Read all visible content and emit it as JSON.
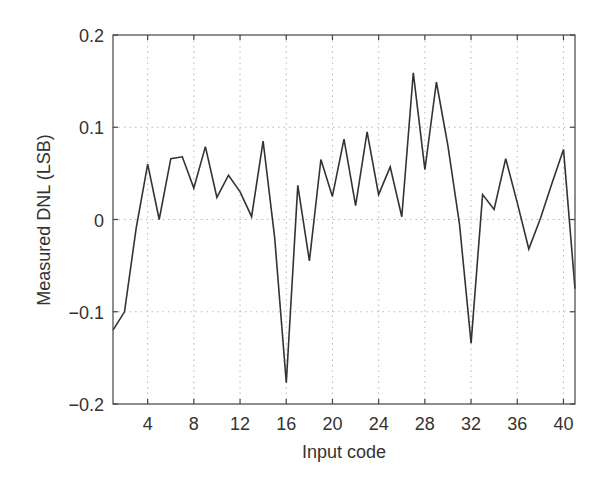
{
  "chart_data": {
    "type": "line",
    "title": "",
    "xlabel": "Input code",
    "ylabel": "Measured DNL (LSB)",
    "xlim": [
      1,
      41
    ],
    "ylim": [
      -0.2,
      0.2
    ],
    "grid": true,
    "legend": null,
    "xticks": [
      4,
      8,
      12,
      16,
      20,
      24,
      28,
      32,
      36,
      40
    ],
    "xtick_labels": [
      "4",
      "8",
      "12",
      "16",
      "20",
      "24",
      "28",
      "32",
      "36",
      "40"
    ],
    "yticks": [
      -0.2,
      -0.1,
      0,
      0.1,
      0.2
    ],
    "ytick_labels": [
      "−0.2",
      "−0.1",
      "0",
      "0.1",
      "0.2"
    ],
    "x": [
      1,
      2,
      3,
      4,
      5,
      6,
      7,
      8,
      9,
      10,
      11,
      12,
      13,
      14,
      15,
      16,
      17,
      18,
      19,
      20,
      21,
      22,
      23,
      24,
      25,
      26,
      27,
      28,
      29,
      30,
      31,
      32,
      33,
      34,
      35,
      36,
      37,
      38,
      39,
      40,
      41
    ],
    "series": [
      {
        "name": "DNL",
        "color": "#333333",
        "values": [
          -0.12,
          -0.1,
          -0.01,
          0.06,
          0.0,
          0.066,
          0.068,
          0.034,
          0.079,
          0.024,
          0.048,
          0.03,
          0.003,
          0.085,
          -0.02,
          -0.177,
          0.037,
          -0.045,
          0.065,
          0.025,
          0.087,
          0.015,
          0.095,
          0.027,
          0.057,
          0.003,
          0.159,
          0.054,
          0.149,
          0.08,
          -0.005,
          -0.134,
          0.027,
          0.011,
          0.066,
          0.018,
          -0.032,
          0.001,
          0.039,
          0.076,
          -0.075
        ]
      }
    ]
  },
  "style": {
    "line_color": "#333333",
    "axis_color": "#444444",
    "grid_color": "#b8b8b8",
    "background": "#ffffff"
  }
}
